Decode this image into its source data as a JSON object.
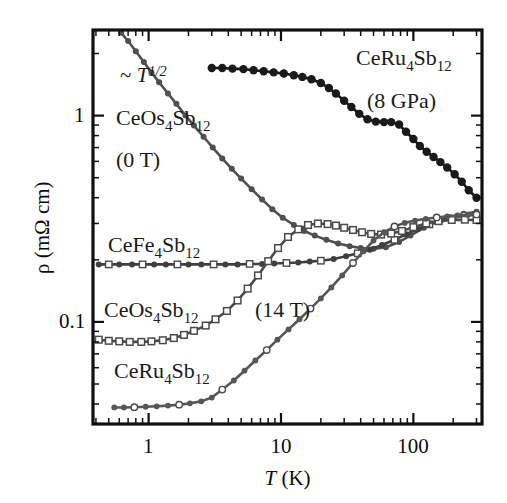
{
  "figure": {
    "kind": "resistivity-vs-temperature-log-log-plot"
  },
  "axis": {
    "x_title_var": "T",
    "x_title_unit": "(K)",
    "y_title": "ρ (mΩ cm)",
    "x_ticks": [
      "1",
      "10",
      "100"
    ],
    "y_ticks": [
      "1",
      "0.1"
    ]
  },
  "annotations": {
    "power_law_prefix": "~ ",
    "power_law_var": "T",
    "power_law_exp": "1/2",
    "ceos_0t_name_a": "CeOs",
    "ceos_0t_name_sub1": "4",
    "ceos_0t_name_b": "Sb",
    "ceos_0t_name_sub2": "12",
    "ceos_0t_field": "(0 T)",
    "ceru_8gpa_name_a": "CeRu",
    "ceru_8gpa_name_sub1": "4",
    "ceru_8gpa_name_b": "Sb",
    "ceru_8gpa_name_sub2": "12",
    "ceru_8gpa_pressure": "(8 GPa)",
    "cefe_name_a": "CeFe",
    "cefe_name_sub1": "4",
    "cefe_name_b": "Sb",
    "cefe_name_sub2": "12",
    "ceos_14t_name_a": "CeOs",
    "ceos_14t_name_sub1": "4",
    "ceos_14t_name_b": "Sb",
    "ceos_14t_name_sub2": "12",
    "ceos_14t_field": "(14 T)",
    "ceru_name_a": "CeRu",
    "ceru_name_sub1": "4",
    "ceru_name_b": "Sb",
    "ceru_name_sub2": "12"
  },
  "colors": {
    "frame": "#101010",
    "text": "#121212",
    "filled_marker": "#1a1a1a",
    "grey_marker": "#5a5a5a",
    "open_marker_edge": "#4a4a4a",
    "open_marker_fill": "#ffffff"
  },
  "chart_data": {
    "type": "line",
    "title": "",
    "xlabel": "T (K)",
    "ylabel": "ρ (mΩ cm)",
    "xscale": "log",
    "yscale": "log",
    "xlim": [
      0.38,
      330
    ],
    "ylim": [
      0.032,
      2.6
    ],
    "grid": false,
    "legend": "inline-annotations",
    "xticks_major": [
      1,
      10,
      100
    ],
    "yticks_major": [
      0.1,
      1
    ],
    "series": [
      {
        "name": "CeOs4Sb12 (0 T)",
        "marker": "filled-circle-grey",
        "color": "#4f4f4f",
        "x": [
          0.62,
          0.7,
          0.8,
          0.92,
          1.05,
          1.2,
          1.4,
          1.62,
          1.9,
          2.2,
          2.6,
          3.05,
          3.6,
          4.25,
          5.0,
          6.0,
          7.2,
          8.6,
          10.3,
          12.5,
          15.0,
          18.0,
          22.0,
          27.0,
          33.0,
          40.0,
          50.0,
          62.0,
          78.0,
          95.0,
          120.0,
          150.0,
          190.0,
          240.0,
          300.0
        ],
        "y": [
          2.52,
          2.3,
          2.05,
          1.82,
          1.62,
          1.45,
          1.28,
          1.14,
          1.0,
          0.895,
          0.79,
          0.7,
          0.62,
          0.552,
          0.495,
          0.44,
          0.392,
          0.352,
          0.32,
          0.295,
          0.276,
          0.262,
          0.25,
          0.24,
          0.233,
          0.228,
          0.226,
          0.23,
          0.244,
          0.262,
          0.286,
          0.306,
          0.322,
          0.334,
          0.342
        ]
      },
      {
        "name": "CeRu4Sb12 (8 GPa)",
        "marker": "filled-circle-black",
        "color": "#171717",
        "x": [
          3.0,
          3.6,
          4.3,
          5.2,
          6.2,
          7.4,
          8.8,
          10.5,
          12.5,
          14.5,
          17.0,
          20.0,
          23.0,
          26.0,
          30.0,
          34.0,
          39.0,
          45.0,
          52.0,
          60.0,
          68.0,
          78.0,
          88.0,
          100.0,
          112.0,
          126.0,
          142.0,
          160.0,
          180.0,
          205.0,
          232.0,
          262.0,
          300.0
        ],
        "y": [
          1.7,
          1.7,
          1.69,
          1.68,
          1.66,
          1.64,
          1.62,
          1.6,
          1.57,
          1.54,
          1.5,
          1.44,
          1.36,
          1.28,
          1.18,
          1.1,
          1.02,
          0.96,
          0.935,
          0.93,
          0.93,
          0.905,
          0.835,
          0.77,
          0.712,
          0.668,
          0.63,
          0.595,
          0.56,
          0.52,
          0.478,
          0.435,
          0.4
        ]
      },
      {
        "name": "CeFe4Sb12",
        "marker": "mixed-open-square-grey",
        "color": "#3f3f3f",
        "x": [
          0.42,
          0.5,
          0.6,
          0.75,
          0.9,
          1.1,
          1.35,
          1.65,
          2.0,
          2.5,
          3.1,
          3.8,
          4.7,
          5.8,
          7.2,
          8.9,
          11.0,
          13.5,
          16.5,
          20.0,
          25.0,
          31.0,
          38.0,
          47.0,
          58.0,
          72.0,
          88.0,
          108.0,
          132.0,
          162.0,
          200.0,
          245.0,
          300.0
        ],
        "y": [
          0.19,
          0.19,
          0.19,
          0.19,
          0.19,
          0.19,
          0.19,
          0.19,
          0.19,
          0.19,
          0.19,
          0.19,
          0.19,
          0.191,
          0.191,
          0.192,
          0.193,
          0.194,
          0.196,
          0.198,
          0.202,
          0.208,
          0.215,
          0.224,
          0.236,
          0.25,
          0.266,
          0.282,
          0.297,
          0.31,
          0.32,
          0.327,
          0.331
        ]
      },
      {
        "name": "CeOs4Sb12 (14 T)",
        "marker": "open-square",
        "color": "#4a4a4a",
        "x": [
          0.42,
          0.5,
          0.6,
          0.72,
          0.88,
          1.05,
          1.28,
          1.55,
          1.85,
          2.2,
          2.7,
          3.2,
          3.9,
          4.7,
          5.6,
          6.7,
          8.0,
          9.5,
          11.3,
          13.5,
          16.0,
          19.0,
          22.5,
          26.0,
          30.0,
          35.0,
          41.0,
          48.0,
          57.0,
          68.0,
          82.0,
          100.0,
          125.0,
          155.0,
          195.0,
          245.0,
          300.0
        ],
        "y": [
          0.082,
          0.081,
          0.0805,
          0.08,
          0.08,
          0.0805,
          0.0815,
          0.0835,
          0.0865,
          0.0905,
          0.096,
          0.103,
          0.113,
          0.127,
          0.145,
          0.168,
          0.197,
          0.228,
          0.258,
          0.281,
          0.295,
          0.3,
          0.298,
          0.293,
          0.286,
          0.279,
          0.272,
          0.267,
          0.265,
          0.268,
          0.276,
          0.288,
          0.3,
          0.308,
          0.312,
          0.313,
          0.312
        ]
      },
      {
        "name": "CeRu4Sb12",
        "marker": "mixed-open-circle-grey",
        "color": "#565656",
        "x": [
          0.55,
          0.65,
          0.78,
          0.95,
          1.15,
          1.4,
          1.7,
          2.05,
          2.5,
          3.0,
          3.6,
          4.4,
          5.3,
          6.4,
          7.8,
          9.4,
          11.4,
          13.8,
          16.7,
          20.0,
          24.0,
          29.0,
          35.0,
          42.0,
          50.0,
          60.0,
          72.0,
          86.0,
          103.0,
          124.0,
          150.0,
          180.0,
          215.0,
          258.0,
          300.0
        ],
        "y": [
          0.0385,
          0.0385,
          0.0386,
          0.0388,
          0.039,
          0.0393,
          0.0397,
          0.0403,
          0.0412,
          0.043,
          0.047,
          0.052,
          0.058,
          0.065,
          0.073,
          0.082,
          0.092,
          0.103,
          0.116,
          0.13,
          0.147,
          0.168,
          0.193,
          0.22,
          0.248,
          0.272,
          0.29,
          0.302,
          0.31,
          0.316,
          0.321,
          0.325,
          0.328,
          0.33,
          0.332
        ]
      }
    ]
  }
}
